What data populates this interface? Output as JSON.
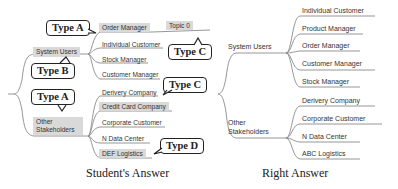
{
  "student": {
    "caption": "Student's Answer",
    "root_branches": [
      {
        "label": "System Users",
        "highlighted": true
      },
      {
        "label_line1": "Other",
        "label_line2": "Stakeholders",
        "highlighted": true
      }
    ],
    "topic_extra": "Topic 0",
    "system_users": [
      {
        "label": "Order Manager",
        "highlighted": true
      },
      {
        "label": "Individual Customer",
        "highlighted": false
      },
      {
        "label": "Stock Manager",
        "highlighted": false
      },
      {
        "label": "Customer Manager",
        "highlighted": false
      }
    ],
    "other_stakeholders": [
      {
        "label": "Derivery Company",
        "highlighted": false
      },
      {
        "label": "Credit Card Company",
        "highlighted": true
      },
      {
        "label": "Corporate Customer",
        "highlighted": false
      },
      {
        "label": "N Data Center",
        "highlighted": false
      },
      {
        "label": "DEF Logistics",
        "highlighted": true
      }
    ],
    "callouts": [
      {
        "label": "Type A",
        "target": "Order Manager"
      },
      {
        "label": "Type C",
        "target": "Topic 0"
      },
      {
        "label": "Type B",
        "target": "System Users"
      },
      {
        "label": "Type A",
        "target": "Other Stakeholders"
      },
      {
        "label": "Type C",
        "target": "Credit Card Company"
      },
      {
        "label": "Type D",
        "target": "DEF Logistics"
      }
    ]
  },
  "right": {
    "caption": "Right Answer",
    "system_users_label": "System Users",
    "other_label_line1": "Other",
    "other_label_line2": "Stakeholders",
    "system_users": [
      "Individual Customer",
      "Product Manager",
      "Order Manager",
      "Customer Manager",
      "Stock Manager"
    ],
    "other_stakeholders": [
      "Derivery Company",
      "Corporate Customer",
      "N Data Center",
      "ABC Logistics"
    ]
  }
}
